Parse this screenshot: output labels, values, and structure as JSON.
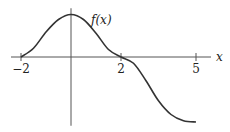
{
  "chart_data": {
    "type": "line",
    "title": "",
    "xlabel": "x",
    "ylabel": "",
    "curve_label": "f(x)",
    "xlim": [
      -2.4,
      5.6
    ],
    "ylim": [
      -2.75,
      1.95
    ],
    "x_ticks": [
      {
        "value": -2,
        "label": "−2"
      },
      {
        "value": 2,
        "label": "2"
      },
      {
        "value": 5,
        "label": "5"
      }
    ],
    "grid": false,
    "series": [
      {
        "name": "f(x)",
        "color": "#333333",
        "points": [
          [
            -2,
            0
          ],
          [
            -1.5,
            0.35
          ],
          [
            -1,
            1.0
          ],
          [
            -0.5,
            1.5
          ],
          [
            0,
            1.7
          ],
          [
            0.5,
            1.5
          ],
          [
            1,
            0.95
          ],
          [
            1.5,
            0.3
          ],
          [
            2,
            0
          ],
          [
            2.5,
            -0.25
          ],
          [
            3,
            -0.95
          ],
          [
            3.5,
            -1.75
          ],
          [
            4,
            -2.3
          ],
          [
            4.5,
            -2.55
          ],
          [
            5,
            -2.6
          ]
        ]
      }
    ]
  }
}
